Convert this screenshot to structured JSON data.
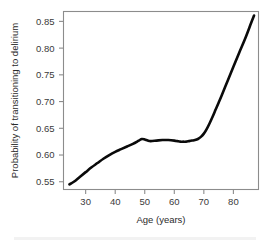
{
  "chart_data": {
    "type": "line",
    "title": "",
    "subtitle": "",
    "xlabel": "Age (years)",
    "ylabel": "Probability of transitioning to delirium",
    "xlim": [
      22.5,
      88.5
    ],
    "ylim": [
      0.5355,
      0.8685
    ],
    "xticks": [
      30,
      40,
      50,
      60,
      70,
      80
    ],
    "xticklabels": [
      "30",
      "40",
      "50",
      "60",
      "70",
      "80"
    ],
    "yticks": [
      0.55,
      0.6,
      0.65,
      0.7,
      0.75,
      0.8,
      0.85
    ],
    "yticklabels": [
      "0.55",
      "0.60",
      "0.65",
      "0.70",
      "0.75",
      "0.80",
      "0.85"
    ],
    "grid": false,
    "legend": null,
    "annotations": [],
    "line_color": "#0a0a0a",
    "frame_color": "#8c8c8c",
    "series": [
      {
        "name": "Probability of transitioning to delirium",
        "x": [
          24.5,
          26,
          28,
          30,
          32,
          34,
          36,
          38,
          40,
          42,
          44,
          46,
          48,
          49,
          50,
          51,
          52,
          54,
          56,
          58,
          60,
          61,
          62,
          63,
          64,
          65,
          66,
          67,
          68,
          69,
          70,
          71,
          72,
          73,
          74,
          75,
          76,
          78,
          80,
          82,
          84,
          86,
          87
        ],
        "y": [
          0.545,
          0.55,
          0.559,
          0.568,
          0.577,
          0.585,
          0.593,
          0.6,
          0.606,
          0.611,
          0.616,
          0.621,
          0.627,
          0.63,
          0.629,
          0.627,
          0.626,
          0.627,
          0.628,
          0.628,
          0.627,
          0.626,
          0.625,
          0.625,
          0.625,
          0.626,
          0.627,
          0.628,
          0.63,
          0.634,
          0.64,
          0.649,
          0.66,
          0.672,
          0.685,
          0.698,
          0.711,
          0.738,
          0.765,
          0.792,
          0.818,
          0.847,
          0.861
        ]
      }
    ]
  },
  "figure": {
    "x_axis_title": "Age (years)",
    "y_axis_title": "Probability of transitioning to delirium"
  }
}
